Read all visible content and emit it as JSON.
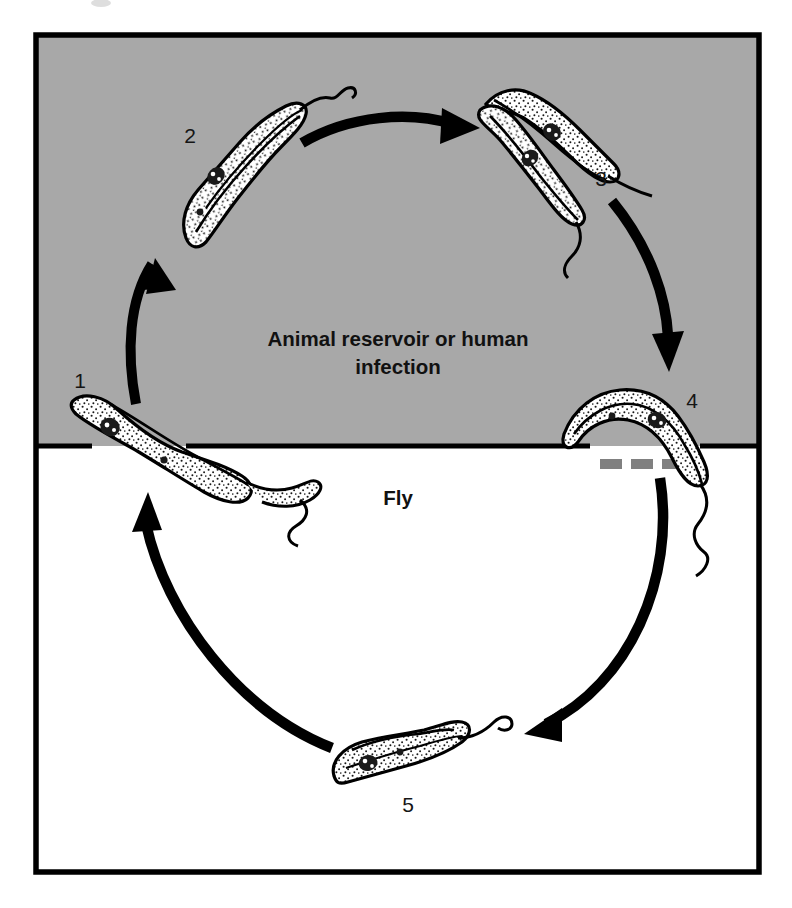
{
  "figure": {
    "kind": "life-cycle-diagram",
    "frame_color": "#000000",
    "upper_zone_fill": "#a8a8a8",
    "lower_zone_fill": "#ffffff",
    "arrow_color": "#000000",
    "dash_color": "#808080",
    "parasite_outline": "#000000",
    "parasite_fill": "#ffffff",
    "nucleus_color": "#1a1a1a"
  },
  "zones": {
    "upper": {
      "name": "animal-reservoir-zone",
      "label_line1": "Animal reservoir or human",
      "label_line2": "infection"
    },
    "lower": {
      "name": "fly-zone",
      "label": "Fly"
    }
  },
  "stages": [
    {
      "id": 1,
      "label": "1",
      "zone": "boundary",
      "description": "single trypomastigote at gray/white boundary, left side"
    },
    {
      "id": 2,
      "label": "2",
      "zone": "upper",
      "description": "single slender trypomastigote, upper left"
    },
    {
      "id": 3,
      "label": "3",
      "zone": "upper",
      "description": "pair of dividing trypomastigotes, upper right"
    },
    {
      "id": 4,
      "label": "4",
      "zone": "boundary",
      "description": "trypomastigote crossing boundary, right side"
    },
    {
      "id": 5,
      "label": "5",
      "zone": "lower",
      "description": "single trypomastigote in fly, bottom center"
    }
  ],
  "arrows": [
    {
      "name": "arrow-1-to-2",
      "from": 1,
      "to": 2,
      "direction": "up-left-arc"
    },
    {
      "name": "arrow-2-to-3",
      "from": 2,
      "to": 3,
      "direction": "rightward-arc-top"
    },
    {
      "name": "arrow-3-to-4",
      "from": 3,
      "to": 4,
      "direction": "down-right-arc"
    },
    {
      "name": "arrow-4-to-5",
      "from": 4,
      "to": 5,
      "direction": "down-left-arc"
    },
    {
      "name": "arrow-5-to-1",
      "from": 5,
      "to": 1,
      "direction": "up-left-arc"
    }
  ],
  "dashed_marker": {
    "name": "gray-dashed-separator",
    "dash_count": 3,
    "color": "#808080"
  }
}
